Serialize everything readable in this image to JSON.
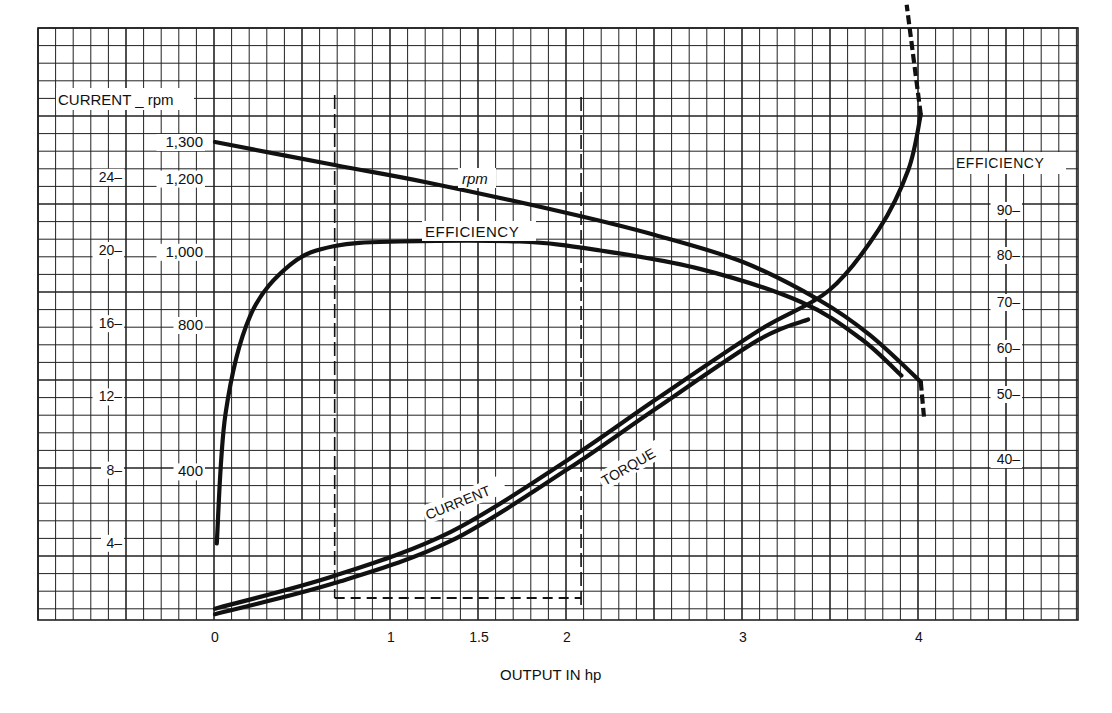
{
  "chart_data": {
    "type": "line",
    "title": "",
    "xlabel": "OUTPUT IN hp",
    "x_ticks": [
      0,
      1,
      1.5,
      2,
      3,
      4
    ],
    "x_tick_labels": [
      "0",
      "1",
      "1.5",
      "2",
      "3",
      "4"
    ],
    "xlim": [
      -1.0,
      4.9
    ],
    "left_axes": [
      {
        "name": "CURRENT",
        "ticks": [
          4,
          8,
          12,
          16,
          20,
          24
        ],
        "tick_labels": [
          "4",
          "8",
          "12",
          "16",
          "20",
          "24"
        ],
        "unit": "A"
      },
      {
        "name": "rpm",
        "ticks": [
          400,
          800,
          1000,
          1200,
          1300
        ],
        "tick_labels": [
          "400",
          "800",
          "1,000",
          "1,200",
          "1,300"
        ]
      }
    ],
    "left_axis_header": "CURRENT _ rpm",
    "right_axis": {
      "name": "EFFICIENCY",
      "ticks": [
        40,
        50,
        60,
        70,
        80,
        90
      ],
      "tick_labels": [
        "40",
        "50",
        "60",
        "70",
        "80",
        "90"
      ],
      "unit": "%"
    },
    "grid": true,
    "legend": "inline curve labels",
    "curve_labels": [
      "rpm",
      "EFFICIENCY",
      "CURRENT",
      "TORQUE"
    ],
    "series": [
      {
        "name": "rpm",
        "axis": "rpm",
        "x": [
          0,
          0.68,
          1.22,
          2.0,
          2.5,
          3.0,
          3.43,
          3.72,
          4.01
        ],
        "values": [
          1300,
          1237,
          1188,
          1106,
          1046,
          972,
          869,
          773,
          645
        ],
        "dashed_tail": {
          "x": [
            4.01,
            4.03
          ],
          "values": [
            645,
            540
          ]
        }
      },
      {
        "name": "EFFICIENCY",
        "axis": "efficiency",
        "x": [
          0.01,
          0.06,
          0.2,
          0.43,
          0.68,
          1.05,
          1.73,
          2.19,
          2.76,
          3.33,
          3.67,
          3.9
        ],
        "values": [
          27,
          47,
          67,
          78,
          82,
          83,
          83,
          81,
          77,
          70,
          62,
          54
        ]
      },
      {
        "name": "CURRENT",
        "axis": "current",
        "x": [
          0,
          0.68,
          1.34,
          2.0,
          2.5,
          3.09,
          3.49,
          3.77,
          3.94,
          4.01
        ],
        "values": [
          0.4,
          2.2,
          4.6,
          8.5,
          11.8,
          15.6,
          17.8,
          21.1,
          24.4,
          27.4
        ],
        "dashed_tail": {
          "x": [
            4.01,
            3.93
          ],
          "values": [
            27.4,
            33.4
          ]
        }
      },
      {
        "name": "TORQUE",
        "axis": "current-scale",
        "x": [
          0,
          0.68,
          1.34,
          2.0,
          2.5,
          3.09,
          3.37
        ],
        "values": [
          0.1,
          1.8,
          4.1,
          8.0,
          11.3,
          15.1,
          16.2
        ]
      }
    ],
    "annotations": [
      {
        "type": "dashed-rectangle",
        "x_range_hp": [
          0.68,
          2.08
        ],
        "bottom_current": 1.0
      }
    ]
  },
  "labels": {
    "left_header": "CURRENT _ rpm",
    "right_header": "EFFICIENCY",
    "x_axis_title": "OUTPUT IN hp",
    "curve_rpm": "rpm",
    "curve_efficiency": "EFFICIENCY",
    "curve_current": "CURRENT",
    "curve_torque": "TORQUE"
  }
}
